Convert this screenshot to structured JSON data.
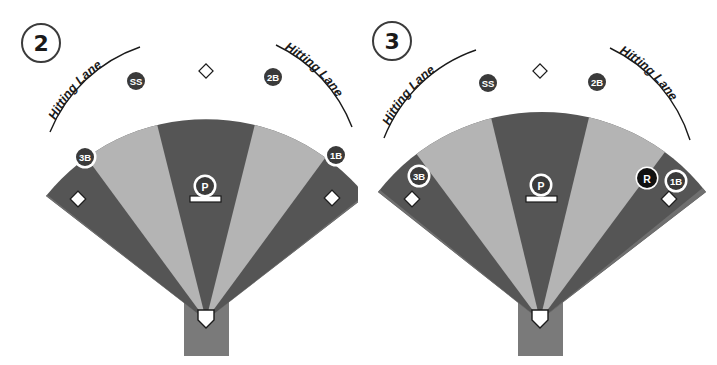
{
  "figure": {
    "panel_count": 2
  },
  "colors": {
    "background": "#ffffff",
    "field_dark": "#555555",
    "field_mid": "#6f6f6f",
    "field_light": "#b4b4b4",
    "backstop": "#7a7a7a",
    "marker_fill": "#3a3a3a",
    "marker_ring": "#ffffff",
    "marker_text": "#ffffff",
    "runner_fill": "#111111",
    "base_fill": "#ffffff",
    "base_stroke": "#1a1a1a",
    "label_text": "#1a1a1a",
    "lane_arc": "#1a1a1a"
  },
  "panels": [
    {
      "id": "panel-2",
      "step_number": "2",
      "lane_labels": {
        "left": "Hitting Lane",
        "right": "Hitting Lane"
      },
      "fielders": [
        {
          "code": "SS",
          "name": "shortstop",
          "x": 136,
          "y": 81,
          "style": "ring"
        },
        {
          "code": "2B",
          "name": "second-base",
          "x": 273,
          "y": 77,
          "style": "ring"
        },
        {
          "code": "3B",
          "name": "third-base",
          "x": 85,
          "y": 157,
          "style": "ring"
        },
        {
          "code": "1B",
          "name": "first-base",
          "x": 336,
          "y": 155,
          "style": "ring"
        },
        {
          "code": "P",
          "name": "pitcher",
          "x": 205,
          "y": 186,
          "style": "ring"
        }
      ],
      "runners": [],
      "bases": [
        {
          "name": "second-base-bag",
          "x": 206,
          "y": 71
        },
        {
          "name": "third-base-bag",
          "x": 78,
          "y": 199
        },
        {
          "name": "first-base-bag",
          "x": 332,
          "y": 198
        }
      ],
      "home_plate": {
        "name": "home-plate",
        "x": 206,
        "y": 320
      },
      "pitching_rubber": {
        "name": "pitching-rubber",
        "x": 205,
        "y": 199
      }
    },
    {
      "id": "panel-3",
      "step_number": "3",
      "lane_labels": {
        "left": "Hitting Lane",
        "right": "Hitting Lane"
      },
      "fielders": [
        {
          "code": "SS",
          "name": "shortstop",
          "x": 130,
          "y": 83,
          "style": "ring"
        },
        {
          "code": "2B",
          "name": "second-base",
          "x": 239,
          "y": 82,
          "style": "ring"
        },
        {
          "code": "3B",
          "name": "third-base",
          "x": 61,
          "y": 176,
          "style": "ring"
        },
        {
          "code": "1B",
          "name": "first-base",
          "x": 318,
          "y": 181,
          "style": "ring"
        },
        {
          "code": "P",
          "name": "pitcher",
          "x": 183,
          "y": 185,
          "style": "ring"
        }
      ],
      "runners": [
        {
          "code": "R",
          "name": "runner",
          "x": 289,
          "y": 178,
          "style": "solid"
        }
      ],
      "bases": [
        {
          "name": "second-base-bag",
          "x": 182,
          "y": 71
        },
        {
          "name": "third-base-bag",
          "x": 54,
          "y": 199
        },
        {
          "name": "first-base-bag",
          "x": 311,
          "y": 199
        }
      ],
      "home_plate": {
        "name": "home-plate",
        "x": 182,
        "y": 320
      },
      "pitching_rubber": {
        "name": "pitching-rubber",
        "x": 183,
        "y": 199
      }
    }
  ],
  "legend": {
    "marker_meaning_ss": "SS",
    "marker_meaning_2b": "2B",
    "marker_meaning_3b": "3B",
    "marker_meaning_1b": "1B",
    "marker_meaning_p": "P",
    "marker_meaning_r": "R"
  }
}
